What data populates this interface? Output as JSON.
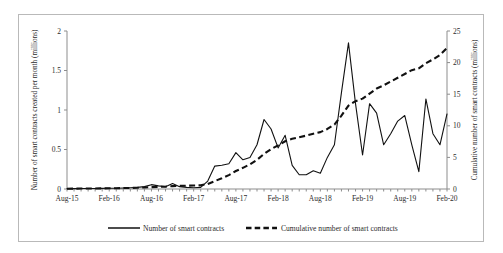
{
  "chart_data": {
    "type": "line",
    "title": "",
    "xlabel": "",
    "ylabel": "Number of smart contracts created per month (millions)",
    "y2label": "Cumulative number of smart contracts (millions)",
    "grid": false,
    "legend_position": "bottom",
    "xlim": [
      "Aug-15",
      "Feb-20"
    ],
    "ylim": [
      0,
      2
    ],
    "y2lim": [
      0,
      25
    ],
    "yticks": [
      "0",
      "0.5",
      "1",
      "1.5",
      "2"
    ],
    "ytick_values": [
      0,
      0.5,
      1,
      1.5,
      2
    ],
    "y2ticks": [
      "0",
      "5",
      "10",
      "15",
      "20",
      "25"
    ],
    "y2tick_values": [
      0,
      5,
      10,
      15,
      20,
      25
    ],
    "xticks": [
      "Aug-15",
      "Feb-16",
      "Aug-16",
      "Feb-17",
      "Aug-17",
      "Feb-18",
      "Aug-18",
      "Feb-19",
      "Aug-19",
      "Feb-20"
    ],
    "x": [
      "Aug-15",
      "Sep-15",
      "Oct-15",
      "Nov-15",
      "Dec-15",
      "Jan-16",
      "Feb-16",
      "Mar-16",
      "Apr-16",
      "May-16",
      "Jun-16",
      "Jul-16",
      "Aug-16",
      "Sep-16",
      "Oct-16",
      "Nov-16",
      "Dec-16",
      "Jan-17",
      "Feb-17",
      "Mar-17",
      "Apr-17",
      "May-17",
      "Jun-17",
      "Jul-17",
      "Aug-17",
      "Sep-17",
      "Oct-17",
      "Nov-17",
      "Dec-17",
      "Jan-18",
      "Feb-18",
      "Mar-18",
      "Apr-18",
      "May-18",
      "Jun-18",
      "Jul-18",
      "Aug-18",
      "Sep-18",
      "Oct-18",
      "Nov-18",
      "Dec-18",
      "Jan-19",
      "Feb-19",
      "Mar-19",
      "Apr-19",
      "May-19",
      "Jun-19",
      "Jul-19",
      "Aug-19",
      "Sep-19",
      "Oct-19",
      "Nov-19",
      "Dec-19",
      "Jan-20",
      "Feb-20"
    ],
    "series": [
      {
        "name": "Number of smart contracts",
        "axis": "left",
        "style": "solid",
        "unit": "millions per month",
        "values": [
          0.005,
          0.005,
          0.006,
          0.006,
          0.007,
          0.008,
          0.009,
          0.01,
          0.012,
          0.015,
          0.02,
          0.03,
          0.055,
          0.04,
          0.03,
          0.07,
          0.03,
          0.02,
          0.015,
          0.02,
          0.1,
          0.29,
          0.3,
          0.32,
          0.46,
          0.37,
          0.4,
          0.56,
          0.88,
          0.76,
          0.52,
          0.68,
          0.3,
          0.18,
          0.18,
          0.23,
          0.2,
          0.4,
          0.56,
          1.22,
          1.85,
          1.08,
          0.43,
          1.08,
          0.96,
          0.56,
          0.7,
          0.86,
          0.93,
          0.56,
          0.22,
          1.14,
          0.7,
          0.56,
          0.95
        ]
      },
      {
        "name": "Cumulative number of smart contracts",
        "axis": "right",
        "style": "dashed",
        "unit": "millions",
        "values": [
          0.05,
          0.06,
          0.07,
          0.08,
          0.09,
          0.1,
          0.12,
          0.13,
          0.15,
          0.17,
          0.2,
          0.24,
          0.3,
          0.34,
          0.38,
          0.45,
          0.49,
          0.52,
          0.55,
          0.58,
          0.8,
          1.25,
          1.7,
          2.2,
          2.85,
          3.35,
          3.9,
          4.6,
          5.55,
          6.3,
          6.9,
          7.55,
          7.95,
          8.2,
          8.45,
          8.75,
          9.0,
          9.5,
          10.2,
          11.6,
          13.2,
          13.9,
          14.3,
          15.1,
          15.9,
          16.4,
          17.0,
          17.6,
          18.2,
          18.8,
          19.1,
          19.9,
          20.5,
          21.2,
          22.3
        ]
      }
    ]
  },
  "legend": {
    "items": [
      {
        "label": "Number of smart contracts",
        "style": "solid"
      },
      {
        "label": "Cumulative number of smart contracts",
        "style": "dashed"
      }
    ]
  }
}
